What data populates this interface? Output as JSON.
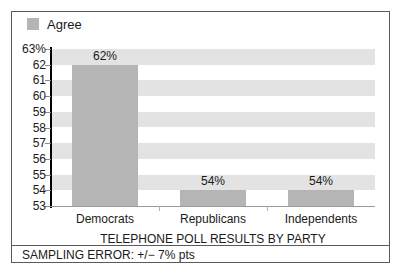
{
  "legend": {
    "position": "top-left",
    "entries": [
      {
        "label": "Agree",
        "color": "#b5b5b5",
        "icon": "legend-swatch"
      }
    ]
  },
  "footer": {
    "note": "SAMPLING ERROR: +/− 7% pts"
  },
  "chart_data": {
    "type": "bar",
    "title": "",
    "xlabel": "TELEPHONE POLL RESULTS BY PARTY",
    "ylabel": "",
    "categories": [
      "Democrats",
      "Republicans",
      "Independents"
    ],
    "values": [
      62,
      54,
      54
    ],
    "data_labels": [
      "62%",
      "54%",
      "54%"
    ],
    "series": [
      {
        "name": "Agree",
        "values": [
          62,
          54,
          54
        ],
        "color": "#b5b5b5"
      }
    ],
    "ylim": [
      53,
      63
    ],
    "ytick_values": [
      63,
      62,
      61,
      60,
      59,
      58,
      57,
      56,
      55,
      54,
      53
    ],
    "ytick_labels": [
      "63%",
      "62",
      "61",
      "60",
      "59",
      "58",
      "57",
      "56",
      "55",
      "54",
      "53"
    ],
    "grid": "horizontal-alternating-bands",
    "band_color": "#e3e3e3",
    "plot_background": "#ffffff",
    "legend_position": "top-left",
    "frame_color": "#5a5a5a"
  }
}
